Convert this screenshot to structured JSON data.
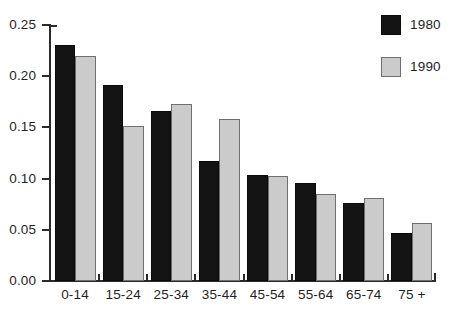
{
  "chart_data": {
    "type": "bar",
    "title": "",
    "subtitle": "",
    "xlabel": "",
    "ylabel": "",
    "categories": [
      "0-14",
      "15-24",
      "25-34",
      "35-44",
      "45-54",
      "55-64",
      "65-74",
      "75 +"
    ],
    "series": [
      {
        "name": "1980",
        "color": "#141414",
        "values": [
          0.23,
          0.191,
          0.166,
          0.117,
          0.104,
          0.096,
          0.076,
          0.047
        ]
      },
      {
        "name": "1990",
        "color": "#cbcbcb",
        "values": [
          0.22,
          0.151,
          0.173,
          0.158,
          0.103,
          0.085,
          0.081,
          0.057
        ]
      }
    ],
    "ylim": [
      0.0,
      0.25
    ],
    "ytick_labels": [
      "0.00",
      "0.05",
      "0.10",
      "0.15",
      "0.20",
      "0.25"
    ],
    "ytick_values": [
      0.0,
      0.05,
      0.1,
      0.15,
      0.2,
      0.25
    ],
    "grid": false,
    "legend_position": "top-right",
    "legend_entries": [
      "1980",
      "1990"
    ]
  }
}
